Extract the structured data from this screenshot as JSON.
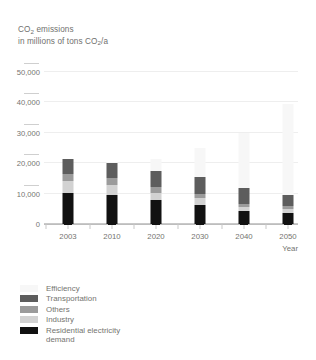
{
  "chart_data": {
    "type": "bar",
    "stacked": true,
    "title": "CO2 emissions in millions of tons CO2/a",
    "title_line1": "CO",
    "title_line1_sub": "2",
    "title_line1_rest": " emissions",
    "title_line2_a": "in millions of tons  CO",
    "title_line2_sub": "2",
    "title_line2_b": "/a",
    "xlabel": "Year",
    "ylabel": "",
    "categories": [
      "2003",
      "2010",
      "2020",
      "2030",
      "2040",
      "2050"
    ],
    "ylim": [
      0,
      50000
    ],
    "yticks": [
      0,
      10000,
      20000,
      30000,
      40000,
      50000
    ],
    "ytick_labels": [
      "0",
      "10,000",
      "20,000",
      "30,000",
      "40,000",
      "50,000"
    ],
    "grid": true,
    "legend_position": "below",
    "series": [
      {
        "name": "Residential electricity demand",
        "color": "#111111",
        "values": [
          10300,
          9500,
          7800,
          6300,
          4400,
          3700
        ]
      },
      {
        "name": "Industry",
        "color": "#d2d2d2",
        "values": [
          3800,
          3500,
          2300,
          2200,
          1300,
          1300
        ]
      },
      {
        "name": "Others",
        "color": "#9b9b9b",
        "values": [
          2500,
          2300,
          2000,
          1500,
          900,
          900
        ]
      },
      {
        "name": "Transportation",
        "color": "#5d5d5d",
        "values": [
          4900,
          4700,
          5400,
          5500,
          5400,
          3600
        ]
      },
      {
        "name": "Efficiency",
        "color": "#f7f7f7",
        "values": [
          0,
          500,
          4000,
          9500,
          18000,
          30000
        ]
      }
    ],
    "totals": [
      21500,
      20500,
      17500,
      15500,
      12000,
      9500
    ]
  },
  "legend": {
    "items": [
      {
        "label": "Efficiency",
        "color": "#f7f7f7"
      },
      {
        "label": "Transportation",
        "color": "#5d5d5d"
      },
      {
        "label": "Others",
        "color": "#9b9b9b"
      },
      {
        "label": "Industry",
        "color": "#d2d2d2"
      },
      {
        "label": "Residential electricity\ndemand",
        "color": "#111111"
      }
    ]
  }
}
